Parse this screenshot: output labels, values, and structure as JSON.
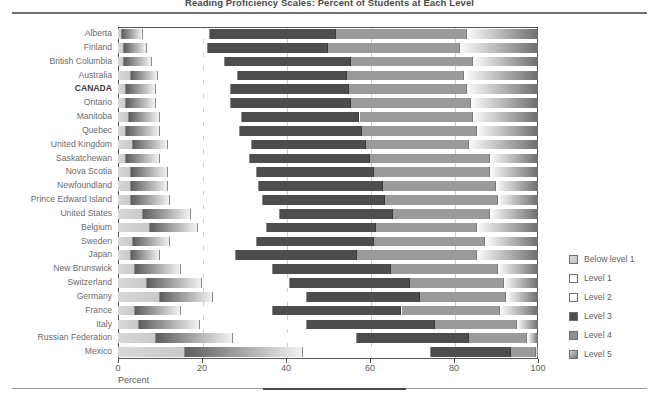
{
  "chart_data": {
    "type": "bar",
    "subtype": "stacked-horizontal-100",
    "title": "Reading Proficiency Scales: Percent of Students at Each Level",
    "xlabel": "Percent",
    "ylabel": "",
    "xlim": [
      0,
      100
    ],
    "xticks": [
      0,
      20,
      40,
      60,
      80,
      100
    ],
    "grid": true,
    "legend_position": "right",
    "legend": [
      "Below level 1",
      "Level 1",
      "Level 2",
      "Level 3",
      "Level 4",
      "Level 5"
    ],
    "categories": [
      "Alberta",
      "Finland",
      "British Columbia",
      "Australia",
      "CANADA",
      "Ontario",
      "Manitoba",
      "Quebec",
      "United Kingdom",
      "Saskatchewan",
      "Nova Scotia",
      "Newfoundland",
      "Prince Edward Island",
      "United States",
      "Belgium",
      "Sweden",
      "Japan",
      "New Brunswick",
      "Switzerland",
      "Germany",
      "France",
      "Italy",
      "Russian Federation",
      "Mexico"
    ],
    "highlighted_categories": [
      "CANADA"
    ],
    "series": [
      {
        "name": "Below level 1",
        "values": [
          1.0,
          1.5,
          1.5,
          3.0,
          2.0,
          2.0,
          2.5,
          2.0,
          3.5,
          2.0,
          3.0,
          3.0,
          3.0,
          6.0,
          7.5,
          3.5,
          3.0,
          4.0,
          7.0,
          10.0,
          4.0,
          5.0,
          9.0,
          16.0
        ]
      },
      {
        "name": "Level 1",
        "values": [
          5.0,
          5.5,
          6.5,
          6.5,
          7.0,
          7.0,
          7.5,
          8.0,
          8.5,
          8.0,
          9.0,
          9.0,
          9.5,
          11.5,
          11.5,
          9.0,
          7.0,
          11.0,
          13.0,
          12.5,
          11.0,
          14.5,
          18.5,
          28.0
        ]
      },
      {
        "name": "Level 2",
        "values": [
          16.0,
          14.5,
          17.5,
          19.0,
          18.0,
          18.0,
          19.5,
          19.0,
          20.0,
          21.5,
          21.0,
          21.5,
          22.0,
          21.0,
          16.5,
          20.5,
          18.0,
          22.0,
          21.0,
          22.5,
          22.0,
          25.5,
          29.5,
          30.5
        ]
      },
      {
        "name": "Level 3",
        "values": [
          30.0,
          28.5,
          30.0,
          26.0,
          28.0,
          28.5,
          28.0,
          29.0,
          27.0,
          28.5,
          28.0,
          29.5,
          29.0,
          27.0,
          26.0,
          28.0,
          29.0,
          28.0,
          28.5,
          27.0,
          30.5,
          30.5,
          26.5,
          19.0
        ]
      },
      {
        "name": "Level 4",
        "values": [
          31.0,
          31.5,
          29.0,
          28.0,
          28.0,
          28.5,
          27.0,
          27.5,
          24.5,
          28.5,
          27.5,
          27.0,
          27.0,
          23.0,
          24.0,
          26.5,
          28.5,
          25.5,
          22.5,
          20.5,
          23.5,
          19.5,
          14.0,
          6.0
        ]
      },
      {
        "name": "Level 5",
        "values": [
          17.0,
          18.5,
          15.5,
          17.5,
          17.0,
          16.0,
          15.5,
          14.5,
          16.5,
          11.5,
          11.5,
          10.0,
          9.5,
          11.5,
          14.5,
          12.5,
          14.5,
          9.5,
          8.0,
          7.5,
          9.0,
          5.0,
          2.5,
          0.5
        ]
      }
    ]
  },
  "axis": {
    "x_tick_labels": [
      "0",
      "20",
      "40",
      "60",
      "80",
      "100"
    ],
    "x_axis_title": "Percent"
  },
  "colors": {
    "below_level_1": "#d0d0d0",
    "level_1": "#5d5d5d",
    "level_2": "#ffffff",
    "level_3": "#4d4d4d",
    "level_4": "#9a9a9a",
    "level_5": "#8e8e8e",
    "frame": "#555555",
    "gridline": "#cfcfcf",
    "text": "#6b6b6b",
    "rule": "#6f6f6f"
  }
}
